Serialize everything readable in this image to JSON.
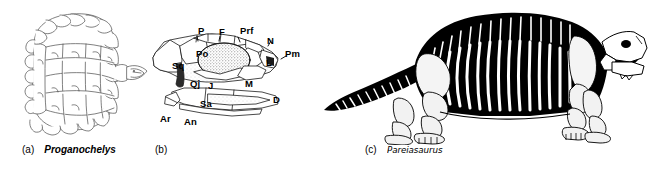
{
  "figure": {
    "background_color": "#ffffff",
    "ink_color": "#000000",
    "width": 649,
    "height": 172
  },
  "panels": [
    {
      "id": "a",
      "tag": "(a)",
      "taxon": "Proganochelys",
      "subject": "turtle-carapace-dorsal-view",
      "description": "Line drawing of a rounded turtle shell seen from above with polygonal scutes and a small pointed head at the right"
    },
    {
      "id": "b",
      "tag": "(b)",
      "taxon": "",
      "subject": "skull-lateral-view-labelled",
      "description": "Lateral view of a reptile skull with stippled orbit and labelled skull bones"
    },
    {
      "id": "c",
      "tag": "(c)",
      "taxon": "Pareiasaurus",
      "subject": "skeleton-lateral-view",
      "description": "Black and white skeletal reconstruction of a stocky quadrupedal reptile facing right"
    }
  ],
  "skull_labels": [
    {
      "abbr": "P",
      "bone": "parietal",
      "x": 198,
      "y": 31
    },
    {
      "abbr": "F",
      "bone": "frontal",
      "x": 219,
      "y": 32
    },
    {
      "abbr": "Prf",
      "bone": "prefrontal",
      "x": 240,
      "y": 31
    },
    {
      "abbr": "N",
      "bone": "nasal",
      "x": 267,
      "y": 41
    },
    {
      "abbr": "Pm",
      "bone": "premaxilla",
      "x": 285,
      "y": 54
    },
    {
      "abbr": "Sq",
      "bone": "squamosal",
      "x": 172,
      "y": 66
    },
    {
      "abbr": "Po",
      "bone": "postorbital",
      "x": 196,
      "y": 54
    },
    {
      "abbr": "L",
      "bone": "lacrimal",
      "x": 266,
      "y": 63
    },
    {
      "abbr": "Qj",
      "bone": "quadratojugal",
      "x": 190,
      "y": 84
    },
    {
      "abbr": "J",
      "bone": "jugal",
      "x": 208,
      "y": 86
    },
    {
      "abbr": "M",
      "bone": "maxilla",
      "x": 245,
      "y": 84
    },
    {
      "abbr": "Sa",
      "bone": "surangular",
      "x": 200,
      "y": 104
    },
    {
      "abbr": "D",
      "bone": "dentary",
      "x": 273,
      "y": 100
    },
    {
      "abbr": "Ar",
      "bone": "articular",
      "x": 160,
      "y": 119
    },
    {
      "abbr": "An",
      "bone": "angular",
      "x": 184,
      "y": 122
    }
  ],
  "captions": {
    "a": {
      "tag": "(a)",
      "taxon": "Proganochelys"
    },
    "b": {
      "tag": "(b)",
      "taxon": ""
    },
    "c": {
      "tag": "(c)",
      "taxon": "Pareiasaurus"
    }
  }
}
